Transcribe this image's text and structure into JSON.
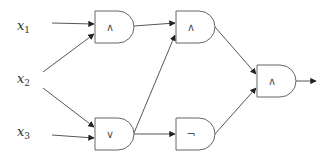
{
  "diagram": {
    "type": "logic-circuit",
    "inputs": [
      {
        "id": "x1",
        "base": "x",
        "sub": "1"
      },
      {
        "id": "x2",
        "base": "x",
        "sub": "2"
      },
      {
        "id": "x3",
        "base": "x",
        "sub": "3"
      }
    ],
    "gates": [
      {
        "id": "g1",
        "op": "∧",
        "kind": "AND",
        "inputs": [
          "x1",
          "x2"
        ]
      },
      {
        "id": "g2",
        "op": "∨",
        "kind": "OR",
        "inputs": [
          "x2",
          "x3"
        ]
      },
      {
        "id": "g3",
        "op": "∧",
        "kind": "AND",
        "inputs": [
          "g1",
          "g2"
        ]
      },
      {
        "id": "g4",
        "op": "¬",
        "kind": "NOT",
        "inputs": [
          "g2"
        ]
      },
      {
        "id": "g5",
        "op": "∧",
        "kind": "AND",
        "inputs": [
          "g3",
          "g4"
        ],
        "output": true
      }
    ],
    "colors": {
      "stroke": "#666666",
      "wire": "#444444",
      "text": "#333333",
      "background": "#ffffff"
    }
  }
}
